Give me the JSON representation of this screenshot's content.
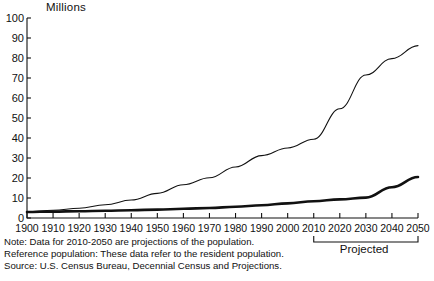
{
  "chart_data": {
    "type": "line",
    "title": "",
    "ylabel": "Millions",
    "xlabel": "",
    "ylim": [
      0,
      100
    ],
    "ytick_step": 10,
    "yticks": [
      "0",
      "10",
      "20",
      "30",
      "40",
      "50",
      "60",
      "70",
      "80",
      "90",
      "100"
    ],
    "grid": false,
    "legend": "none",
    "x": [
      1900,
      1910,
      1920,
      1930,
      1940,
      1950,
      1960,
      1970,
      1980,
      1990,
      2000,
      2010,
      2020,
      2030,
      2040,
      2050
    ],
    "xticks": [
      "1900",
      "1910",
      "1920",
      "1930",
      "1940",
      "1950",
      "1960",
      "1970",
      "1980",
      "1990",
      "2000",
      "2010",
      "2020",
      "2030",
      "2040",
      "2050"
    ],
    "series": [
      {
        "name": "65 years and over",
        "style": "thin",
        "values": [
          3.1,
          3.9,
          4.9,
          6.6,
          9.0,
          12.3,
          16.6,
          20.1,
          25.5,
          31.2,
          35.0,
          39.4,
          54.6,
          71.5,
          79.7,
          86.2
        ]
      },
      {
        "name": "85 years and over",
        "style": "thick",
        "values": [
          3.0,
          3.2,
          3.4,
          3.6,
          3.9,
          4.2,
          4.6,
          5.0,
          5.6,
          6.4,
          7.3,
          8.4,
          9.3,
          10.2,
          15.4,
          20.5
        ]
      }
    ],
    "annotations": [
      {
        "name": "projected-bracket",
        "label": "Projected",
        "from": 2010,
        "to": 2050
      }
    ],
    "notes": [
      "Note: Data for 2010-2050 are projections of the population.",
      "Reference population: These data refer to the resident population.",
      "Source: U.S. Census Bureau, Decennial Census and Projections."
    ]
  },
  "colors": {
    "axis": "#111111",
    "line": "#111111",
    "background": "#ffffff"
  }
}
